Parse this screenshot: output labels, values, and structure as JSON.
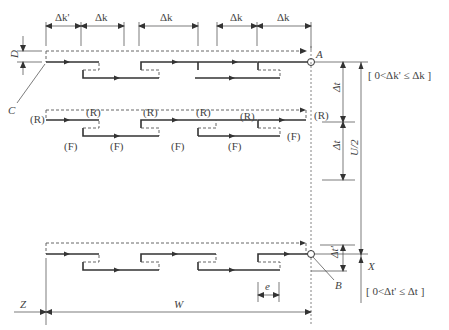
{
  "diagram": {
    "type": "scan-path schematic",
    "top_dimensions": [
      "Δk'",
      "Δk",
      "Δk",
      "Δk",
      "Δk"
    ],
    "labels": {
      "D": "D",
      "C": "C",
      "A": "A",
      "B": "B",
      "X": "X",
      "Z": "Z",
      "W": "W",
      "e": "e",
      "U_half": "U/2",
      "delta_t_1": "Δt",
      "delta_t_2": "Δt",
      "delta_t_prime": "Δt'"
    },
    "constraints": {
      "k": "[ 0<Δk'  ≤ Δk ]",
      "t": "[ 0<Δt'  ≤ Δt ]"
    },
    "row2_markers": {
      "R": [
        "(R)",
        "(R)",
        "(R)",
        "(R)",
        "(R)",
        "(R)"
      ],
      "F": [
        "(F)",
        "(F)",
        "(F)",
        "(F)",
        "(F)"
      ]
    }
  }
}
